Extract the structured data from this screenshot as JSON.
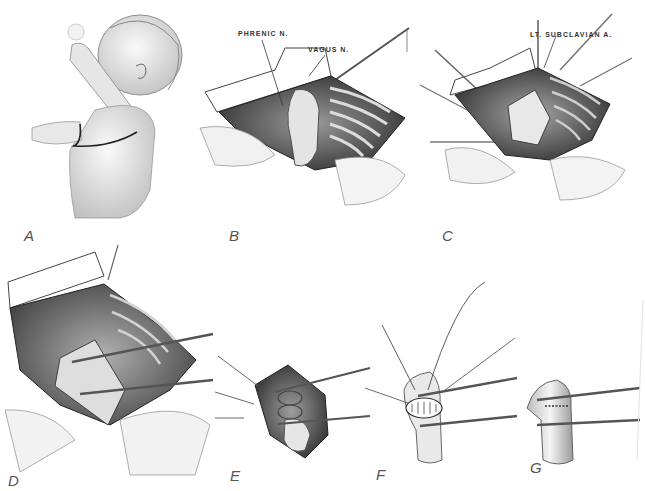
{
  "figure": {
    "panels": [
      {
        "id": "A",
        "label": "A",
        "description": "infant-positioning-incision"
      },
      {
        "id": "B",
        "label": "B",
        "description": "thoracic-exposure",
        "annotations": [
          "PHRENIC N.",
          "VAGUS N."
        ]
      },
      {
        "id": "C",
        "label": "C",
        "description": "aortic-mobilization",
        "annotations": [
          "LT. SUBCLAVIAN A."
        ]
      },
      {
        "id": "D",
        "label": "D",
        "description": "clamps-applied"
      },
      {
        "id": "E",
        "label": "E",
        "description": "coarctation-resection"
      },
      {
        "id": "F",
        "label": "F",
        "description": "end-to-end-anastomosis"
      },
      {
        "id": "G",
        "label": "G",
        "description": "completed-repair"
      }
    ],
    "colors": {
      "ink": "#2a2a2a",
      "shade": "#8a8a8a",
      "light": "#d8d8d8",
      "paper": "#ffffff"
    }
  }
}
